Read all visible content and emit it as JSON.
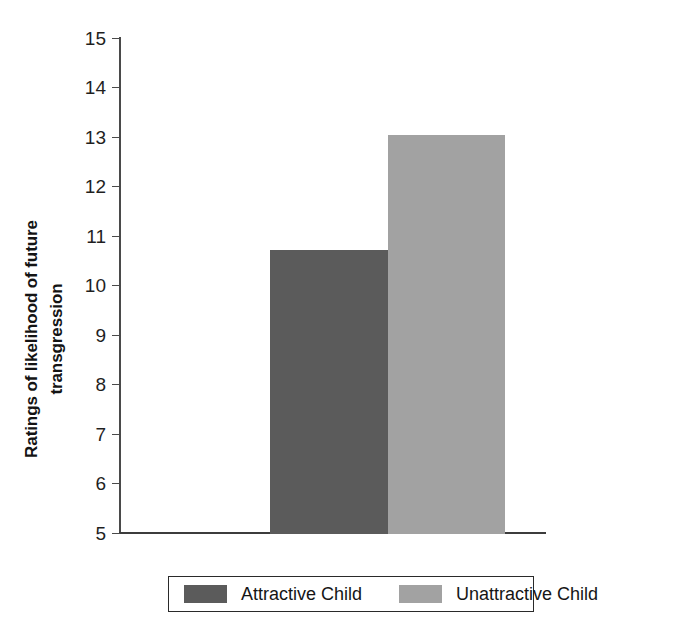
{
  "chart_data": {
    "type": "bar",
    "title": "",
    "xlabel": "",
    "ylabel": "Ratings of likelihood of future transgression",
    "ylabel_lines": [
      "Ratings of likelihood of future",
      "transgression"
    ],
    "categories": [
      "Attractive Child",
      "Unattractive Child"
    ],
    "values": [
      10.72,
      13.05
    ],
    "ylim": [
      5,
      15
    ],
    "yticks": [
      15,
      14,
      13,
      12,
      11,
      10,
      9,
      8,
      7,
      6,
      5
    ],
    "ytick_labels": [
      "15",
      "14",
      "13",
      "12",
      "11",
      "10",
      "9",
      "8",
      "7",
      "6",
      "5"
    ],
    "grid": false,
    "legend_position": "bottom",
    "legend": [
      {
        "label": "Attractive Child",
        "color": "#5b5b5b",
        "value": 10.72
      },
      {
        "label": "Unattractive Child",
        "color": "#a2a2a2",
        "value": 13.05
      }
    ],
    "colors": {
      "attractive": "#5b5b5b",
      "unattractive": "#a2a2a2",
      "axis": "#3c3c3c",
      "text": "#1a1a1a",
      "background": "#ffffff"
    }
  }
}
